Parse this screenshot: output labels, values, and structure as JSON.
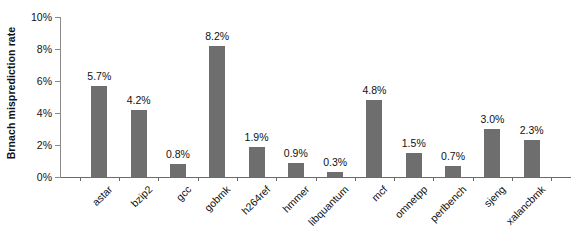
{
  "chart_data": {
    "type": "bar",
    "title": "",
    "xlabel": "",
    "ylabel": "Brnach misprediction rate",
    "ylim": [
      0,
      10
    ],
    "yticks": [
      0,
      2,
      4,
      6,
      8,
      10
    ],
    "ytick_labels": [
      "0%",
      "2%",
      "4%",
      "6%",
      "8%",
      "10%"
    ],
    "grid": false,
    "legend": null,
    "bar_color": "#6e6e6e",
    "value_label_suffix": "%",
    "categories": [
      "astar",
      "bzip2",
      "gcc",
      "gobmk",
      "h264ref",
      "hmmer",
      "libquantum",
      "mcf",
      "omnetpp",
      "perlbench",
      "sjeng",
      "xalancbmk"
    ],
    "values": [
      5.7,
      4.2,
      0.8,
      8.2,
      1.9,
      0.9,
      0.3,
      4.8,
      1.5,
      0.7,
      3.0,
      2.3
    ],
    "value_labels": [
      "5.7%",
      "4.2%",
      "0.8%",
      "8.2%",
      "1.9%",
      "0.9%",
      "0.3%",
      "4.8%",
      "1.5%",
      "0.7%",
      "3.0%",
      "2.3%"
    ]
  }
}
